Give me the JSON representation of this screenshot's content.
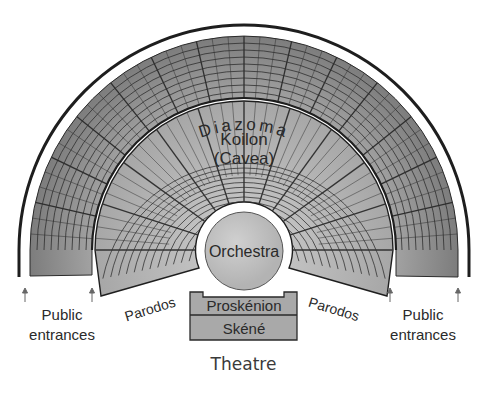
{
  "figure": {
    "caption": "Theatre",
    "labels": {
      "diazoma": "Diazoma",
      "koilon_line1": "Koilon",
      "koilon_line2": "(Cavea)",
      "orchestra": "Orchestra",
      "proskenion": "Proskénion",
      "skene": "Skéné",
      "parodos_left": "Parodos",
      "parodos_right": "Parodos",
      "public_left_line1": "Public",
      "public_left_line2": "entrances",
      "public_right_line1": "Public",
      "public_right_line2": "entrances"
    },
    "colors": {
      "upper_cavea": "#8e8e8e",
      "lower_cavea": "#b4b4b4",
      "orchestra": "#c4c4c4",
      "stage": "#a9a9a9",
      "lines": "#1e1e1e",
      "background": "#ffffff"
    }
  }
}
